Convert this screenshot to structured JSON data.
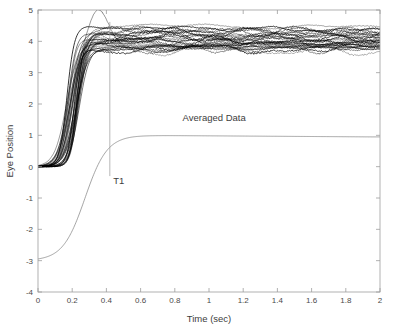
{
  "chart_data": {
    "type": "line",
    "title": "",
    "xlabel": "Time (sec)",
    "ylabel": "Eye Position",
    "xlim": [
      0,
      2
    ],
    "ylim": [
      -4,
      5
    ],
    "grid": false,
    "legend_position": "none",
    "xticks": [
      0,
      0.2,
      0.4,
      0.6,
      0.8,
      1,
      1.2,
      1.4,
      1.6,
      1.8,
      2
    ],
    "xtick_labels": [
      "0",
      "0.2",
      "0.4",
      "0.6",
      "0.8",
      "1",
      "1.2",
      "1.4",
      "1.6",
      "1.8",
      "2"
    ],
    "yticks": [
      -4,
      -3,
      -2,
      -1,
      0,
      1,
      2,
      3,
      4,
      5
    ],
    "ytick_labels": [
      "-4",
      "-3",
      "-2",
      "-1",
      "0",
      "1",
      "2",
      "3",
      "4",
      "5"
    ],
    "annotations": [
      {
        "name": "t1-marker-label",
        "text": "T1",
        "x": 0.44,
        "y": -0.55
      },
      {
        "name": "averaged-data-label",
        "text": "Averaged Data",
        "x": 1.03,
        "y": 1.45
      }
    ],
    "markers": [
      {
        "name": "t1-vertical-line",
        "type": "vline",
        "x": 0.42,
        "y_from": -0.3,
        "y_bigger": 4.62,
        "color": "#9a9a9a"
      }
    ],
    "series_description": {
      "individual_trials": {
        "name": "Individual Trials",
        "color": "#000000",
        "count": 30,
        "baseline": 0.0,
        "onset_time": 0.17,
        "rise_end_time": 0.38,
        "plateau_mean": 4.1,
        "plateau_spread": [
          3.6,
          4.6
        ],
        "overshoot_peak": 4.75,
        "overshoot_time": 0.35
      },
      "averaged_data": {
        "name": "Averaged Data",
        "color": "#808080",
        "baseline": -3.0,
        "onset_time": 0.18,
        "rise_end_time": 0.5,
        "plateau_mean": 1.0,
        "end_value": 0.95
      }
    },
    "x_sample": [
      0,
      0.05,
      0.1,
      0.15,
      0.2,
      0.25,
      0.3,
      0.35,
      0.4,
      0.45,
      0.5,
      0.6,
      0.7,
      0.8,
      0.9,
      1,
      1.1,
      1.2,
      1.3,
      1.4,
      1.5,
      1.6,
      1.7,
      1.8,
      1.9,
      2
    ],
    "series": [
      {
        "name": "Averaged Data",
        "color": "#808080",
        "values": [
          -3,
          -3,
          -3,
          -2.98,
          -2.82,
          -2.1,
          -1.05,
          -0.1,
          0.55,
          0.78,
          0.88,
          0.95,
          0.99,
          1.0,
          1.0,
          1.0,
          1.0,
          1.0,
          1.0,
          1.0,
          1.0,
          1.0,
          0.99,
          0.98,
          0.97,
          0.95
        ]
      },
      {
        "name": "Trial Mean Envelope Upper",
        "color": "#000000",
        "values": [
          0,
          0,
          0.02,
          0.08,
          0.55,
          1.85,
          3.45,
          4.55,
          4.52,
          4.5,
          4.46,
          4.45,
          4.45,
          4.5,
          4.46,
          4.45,
          4.44,
          4.46,
          4.48,
          4.45,
          4.5,
          4.47,
          4.4,
          4.38,
          4.35,
          4.3
        ]
      },
      {
        "name": "Trial Mean Center",
        "color": "#000000",
        "values": [
          0,
          0,
          0.01,
          0.05,
          0.35,
          1.3,
          2.85,
          3.8,
          4.05,
          4.1,
          4.12,
          4.1,
          4.08,
          4.12,
          4.1,
          4.06,
          4.1,
          4.08,
          4.12,
          4.05,
          4.1,
          4.08,
          4.05,
          4.02,
          4.05,
          4.0
        ]
      },
      {
        "name": "Trial Mean Envelope Lower",
        "color": "#000000",
        "values": [
          0,
          0,
          0.0,
          0.02,
          0.18,
          0.8,
          2.1,
          3.0,
          3.3,
          3.5,
          3.6,
          3.68,
          3.72,
          3.75,
          3.78,
          3.72,
          3.75,
          3.78,
          3.76,
          3.7,
          3.74,
          3.72,
          3.68,
          3.65,
          3.68,
          3.62
        ]
      }
    ]
  },
  "axes": {
    "x_title": "Time (sec)",
    "y_title": "Eye Position"
  }
}
